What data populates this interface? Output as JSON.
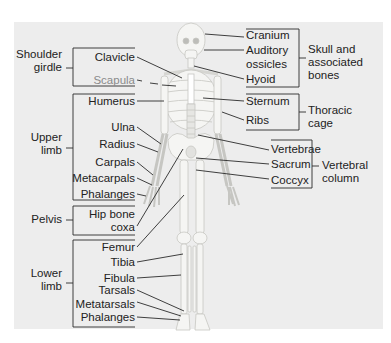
{
  "diagram": {
    "colors": {
      "panel": "#ededed",
      "bone": "#f4f4f2",
      "bone_outline": "#c9c9c6",
      "leader": "#2a2a2a",
      "text": "#222222"
    },
    "left_groups": [
      {
        "id": "shoulder",
        "label_line1": "Shoulder",
        "label_line2": "girdle",
        "items": [
          "Clavicle",
          "Scapula"
        ]
      },
      {
        "id": "upper",
        "label_line1": "Upper",
        "label_line2": "limb",
        "items": [
          "Humerus",
          "Ulna",
          "Radius",
          "Carpals",
          "Metacarpals",
          "Phalanges"
        ]
      },
      {
        "id": "pelvis",
        "label_line1": "Pelvis",
        "label_line2": "",
        "items": [
          "Hip bone",
          "coxa"
        ]
      },
      {
        "id": "lower",
        "label_line1": "Lower",
        "label_line2": "limb",
        "items": [
          "Femur",
          "Tibia",
          "Fibula",
          "Tarsals",
          "Metatarsals",
          "Phalanges"
        ]
      }
    ],
    "right_groups": [
      {
        "id": "skull",
        "label_line1": "Skull and",
        "label_line2": "associated",
        "label_line3": "bones",
        "items": [
          "Cranium",
          "Auditory",
          "ossicles",
          "Hyoid"
        ]
      },
      {
        "id": "thoracic",
        "label_line1": "Thoracic",
        "label_line2": "cage",
        "items": [
          "Sternum",
          "Ribs"
        ]
      },
      {
        "id": "vertebral",
        "label_line1": "Vertebral",
        "label_line2": "column",
        "items": [
          "Vertebrae",
          "Sacrum",
          "Coccyx"
        ]
      }
    ]
  }
}
